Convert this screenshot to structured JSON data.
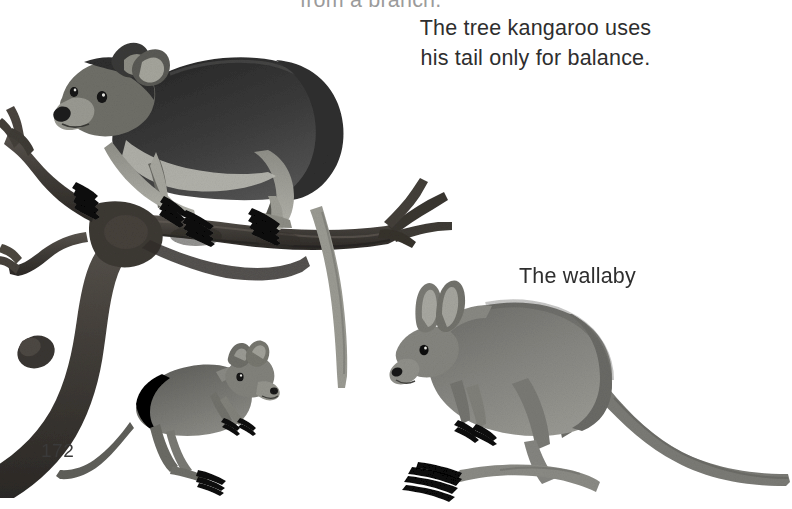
{
  "page": {
    "number": "172",
    "background_color": "#ffffff",
    "text_color": "#2e2e2e",
    "width": 792,
    "height": 509
  },
  "captions": {
    "cutoff_top": "from a branch.",
    "tree_kangaroo_line1": "The tree kangaroo uses",
    "tree_kangaroo_line2": "his tail only for balance.",
    "wallaby": "The wallaby"
  },
  "illustrations": [
    {
      "name": "tree-kangaroo",
      "description": "Tree kangaroo standing on a tree branch with long tail hanging down",
      "fur_dark": "#3a3a3a",
      "fur_light": "#9a9a94"
    },
    {
      "name": "tree-branch",
      "description": "Forked tree branch with twigs extending left and right",
      "color": "#4a4642"
    },
    {
      "name": "rat-kangaroo",
      "description": "Small rat-kangaroo facing right at bottom left",
      "color": "#6e6e6a"
    },
    {
      "name": "wallaby",
      "description": "Wallaby standing with long tail and upright ears",
      "color": "#7e7e7a"
    }
  ]
}
